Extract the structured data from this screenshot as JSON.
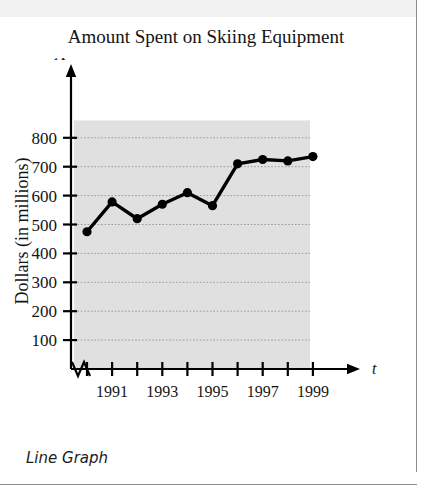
{
  "figure": {
    "title": "Amount Spent on Skiing Equipment",
    "caption": "Line Graph",
    "axis_variable_y": "A",
    "axis_variable_x": "t"
  },
  "colors": {
    "plot_background": "#e0e0e0",
    "line": "#000000",
    "marker": "#000000",
    "gridline": "#9a9a9a",
    "axis": "#000000",
    "text": "#141414",
    "page_background": "#ffffff",
    "rule": "#8a8a8a",
    "top_band": "#f2f2f2"
  },
  "chart_data": {
    "type": "line",
    "title": "Amount Spent on Skiing Equipment",
    "subtitle": "",
    "xlabel": "Year",
    "ylabel": "Dollars (in millions)",
    "x_axis_variable": "t",
    "y_axis_variable": "A",
    "x": [
      1990,
      1991,
      1992,
      1993,
      1994,
      1995,
      1996,
      1997,
      1998,
      1999
    ],
    "values": [
      475,
      578,
      520,
      570,
      610,
      565,
      710,
      725,
      720,
      735
    ],
    "xlim": [
      1989.6,
      1999.8
    ],
    "ylim": [
      0,
      860
    ],
    "y_ticks": [
      100,
      200,
      300,
      400,
      500,
      600,
      700,
      800
    ],
    "y_tick_labels": [
      "100",
      "200",
      "300",
      "400",
      "500",
      "600",
      "700",
      "800"
    ],
    "x_ticks": [
      1990,
      1991,
      1992,
      1993,
      1994,
      1995,
      1996,
      1997,
      1998,
      1999
    ],
    "x_tick_labels": [
      "",
      "1991",
      "",
      "1993",
      "",
      "1995",
      "",
      "1997",
      "",
      "1999"
    ],
    "grid": true,
    "grid_style": "dotted-horizontal",
    "legend": "none",
    "axis_break": true,
    "markers": true,
    "marker_shape": "circle"
  }
}
